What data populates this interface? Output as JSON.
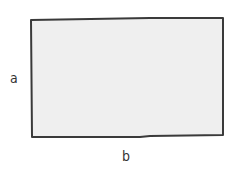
{
  "diagram": {
    "shape": "rectangle",
    "fill_color": "#efefef",
    "stroke_color": "#3a3a3a",
    "labels": {
      "side": "a",
      "bottom": "b"
    }
  }
}
